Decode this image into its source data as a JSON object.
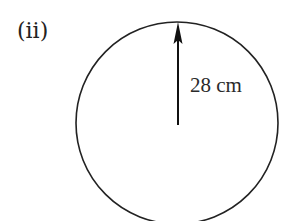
{
  "figure": {
    "part_label": "(ii)",
    "radius_label": "28 cm",
    "shape": "circle",
    "radius_value": 28,
    "radius_unit": "cm",
    "stroke_color": "#222222",
    "background_color": "#ffffff"
  }
}
